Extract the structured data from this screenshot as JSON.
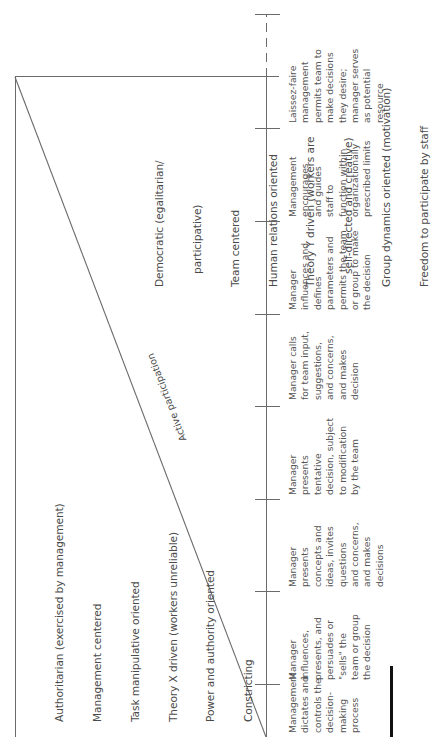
{
  "diagram": {
    "diagonal_label": "Active participation",
    "authoritarian": {
      "lines": [
        "Authoritarian (exercised by management)",
        "Management centered",
        "Task manipulative oriented",
        "Theory X driven (workers unreliable)",
        "Power and authority oriented",
        "Constricting"
      ]
    },
    "democratic": {
      "lines": [
        "Democratic (egalitarian/",
        "    participative)",
        "Team centered",
        "Human relations oriented",
        "Theory Y driven (workers are",
        "    self-directed and creative)",
        "Group dynamics oriented (motivation)",
        "Freedom to participate by staff"
      ]
    },
    "continuum": [
      {
        "text": "Management\ndictates and\ncontrols the\ndecision-\nmaking\nprocess"
      },
      {
        "text": "Manager\ninfluences,\npresents, and\npersuades or\n\"sells\" the\nteam or group\nthe decision"
      },
      {
        "text": "Manager\npresents\nconcepts and\nideas, invites\nquestions\nand concerns,\nand makes\ndecisions"
      },
      {
        "text": "Manager\npresents\ntentative\ndecision, subject\nto modification\nby the team"
      },
      {
        "text": "Manager calls\nfor team input,\nsuggestions,\nand concerns,\nand makes\ndecision"
      },
      {
        "text": "Manager\ninfluences and\ndefines\nparameters and\npermits the team\nor group to make\nthe decision"
      },
      {
        "text": "Management\nencourages\nand guides\nstaff to\nfunction within\norganizationally\nprescribed limits"
      },
      {
        "text": "Laissez-faire\nmanagement\npermits team to\nmake decisions\nthey desire;\nmanager serves\nas potential\nresource"
      }
    ],
    "colors": {
      "line": "#6a6a6a",
      "text": "#4a4a4a",
      "bar": "#111111"
    }
  }
}
